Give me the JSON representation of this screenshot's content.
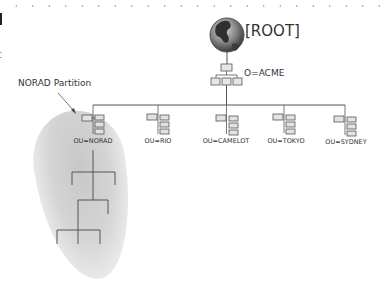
{
  "diagram": {
    "root": {
      "label": "[ROOT]",
      "icon": "globe-icon"
    },
    "organization": {
      "label": "O=ACME",
      "icon": "org-tree-icon"
    },
    "partition": {
      "label": "NORAD Partition"
    },
    "organizational_units": [
      {
        "label": "OU=NORAD",
        "x": 93
      },
      {
        "label": "OU=RIO",
        "x": 158
      },
      {
        "label": "OU=CAMELOT",
        "x": 226
      },
      {
        "label": "OU=TOKYO",
        "x": 284
      },
      {
        "label": "OU=SYDNEY",
        "x": 345
      }
    ],
    "colors": {
      "line": "#555555",
      "partition_shade": "#cccccc",
      "globe_ocean": "#8a8a8a",
      "globe_land": "#3a3a3a"
    }
  }
}
